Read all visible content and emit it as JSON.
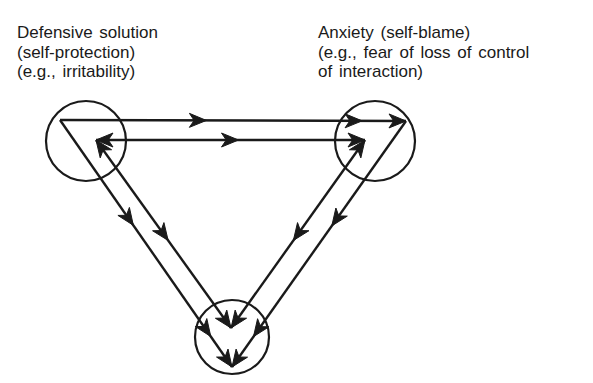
{
  "diagram": {
    "nodes": [
      {
        "id": "defensive",
        "lines": [
          "Defensive solution",
          "(self-protection)",
          "(e.g., irritability)"
        ]
      },
      {
        "id": "anxiety",
        "lines": [
          "Anxiety (self-blame)",
          "(e.g., fear of loss of control",
          "of interaction)"
        ]
      },
      {
        "id": "bottom",
        "lines": []
      }
    ],
    "edges": [
      {
        "from": "defensive",
        "to": "anxiety",
        "path": "outer",
        "direction": "forward"
      },
      {
        "from": "anxiety",
        "to": "defensive",
        "path": "inner",
        "direction": "bidirectional"
      },
      {
        "from": "anxiety",
        "to": "bottom",
        "path": "outer",
        "direction": "forward"
      },
      {
        "from": "bottom",
        "to": "anxiety",
        "path": "inner",
        "direction": "bidirectional"
      },
      {
        "from": "defensive",
        "to": "bottom",
        "path": "outer",
        "direction": "forward"
      },
      {
        "from": "bottom",
        "to": "defensive",
        "path": "inner",
        "direction": "bidirectional"
      }
    ],
    "colors": {
      "stroke": "#1a1a1a",
      "background": "#ffffff"
    }
  }
}
